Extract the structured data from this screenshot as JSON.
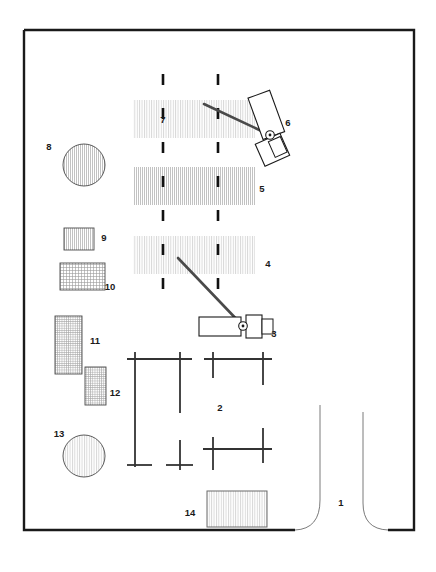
{
  "figure": {
    "type": "technical-floor-plan",
    "title": "",
    "background_color": "#ffffff",
    "line_color": "#1a1a1a",
    "hatch_color": "#9a9a9a",
    "width": 436,
    "height": 572
  },
  "frame": {
    "name": "enclosure-outline",
    "x": 24,
    "y": 30,
    "width": 390,
    "height": 500,
    "stroke_width": 2.4
  },
  "labels": [
    {
      "id": "1",
      "text": "1",
      "x": 341,
      "y": 506,
      "target": "entrance-opening"
    },
    {
      "id": "2",
      "text": "2",
      "x": 220,
      "y": 411,
      "target": "crosshair-grid"
    },
    {
      "id": "3",
      "text": "3",
      "x": 274,
      "y": 337,
      "target": "vehicle-lower"
    },
    {
      "id": "4",
      "text": "4",
      "x": 268,
      "y": 267,
      "target": "band-4"
    },
    {
      "id": "5",
      "text": "5",
      "x": 262,
      "y": 192,
      "target": "band-5"
    },
    {
      "id": "6",
      "text": "6",
      "x": 288,
      "y": 126,
      "target": "vehicle-upper"
    },
    {
      "id": "7",
      "text": "7",
      "x": 163,
      "y": 123,
      "target": "band-7"
    },
    {
      "id": "8",
      "text": "8",
      "x": 49,
      "y": 150,
      "target": "circle-8"
    },
    {
      "id": "9",
      "text": "9",
      "x": 104,
      "y": 241,
      "target": "rect-9"
    },
    {
      "id": "10",
      "text": "10",
      "x": 107,
      "y": 290,
      "target": "rect-10"
    },
    {
      "id": "11",
      "text": "11",
      "x": 92,
      "y": 344,
      "target": "rect-11"
    },
    {
      "id": "12",
      "text": "12",
      "x": 112,
      "y": 396,
      "target": "rect-12"
    },
    {
      "id": "13",
      "text": "13",
      "x": 59,
      "y": 437,
      "target": "circle-13"
    },
    {
      "id": "14",
      "text": "14",
      "x": 190,
      "y": 516,
      "target": "rect-14"
    }
  ],
  "bands": [
    {
      "name": "band-7",
      "x": 133,
      "y": 100,
      "width": 122,
      "height": 38
    },
    {
      "name": "band-5",
      "x": 133,
      "y": 167,
      "width": 122,
      "height": 38
    },
    {
      "name": "band-4",
      "x": 133,
      "y": 236,
      "width": 122,
      "height": 38
    }
  ],
  "dashed_lines": [
    {
      "name": "dashed-line-left",
      "x": 163,
      "y1": 74,
      "y2": 297
    },
    {
      "name": "dashed-line-right",
      "x": 218,
      "y1": 74,
      "y2": 297
    }
  ],
  "circles": [
    {
      "name": "circle-8",
      "cx": 84,
      "cy": 165,
      "r": 21
    },
    {
      "name": "circle-13",
      "cx": 84,
      "cy": 456,
      "r": 21
    }
  ],
  "rects": [
    {
      "name": "rect-9",
      "x": 64,
      "y": 228,
      "width": 30,
      "height": 22
    },
    {
      "name": "rect-10",
      "x": 60,
      "y": 263,
      "width": 45,
      "height": 27
    },
    {
      "name": "rect-11",
      "x": 55,
      "y": 316,
      "width": 27,
      "height": 58
    },
    {
      "name": "rect-12",
      "x": 85,
      "y": 367,
      "width": 21,
      "height": 38
    },
    {
      "name": "rect-14",
      "x": 207,
      "y": 491,
      "width": 60,
      "height": 36
    }
  ],
  "vehicles": [
    {
      "name": "vehicle-upper",
      "label_ref": "6",
      "rotation": -22,
      "body": {
        "x": 263,
        "y": 95,
        "width": 22,
        "height": 42
      },
      "cab": {
        "x": 264,
        "y": 140,
        "width": 26,
        "height": 22
      },
      "pivot": {
        "cx": 271,
        "cy": 136,
        "r": 4
      }
    },
    {
      "name": "vehicle-lower",
      "label_ref": "3",
      "rotation": 0,
      "body": {
        "x": 199,
        "y": 316,
        "width": 42,
        "height": 20
      },
      "cab": {
        "x": 245,
        "y": 314,
        "width": 16,
        "height": 23
      },
      "tail": {
        "x": 261,
        "y": 318,
        "width": 10,
        "height": 15
      },
      "pivot": {
        "cx": 243,
        "cy": 326,
        "r": 4
      }
    }
  ],
  "boom_arms": [
    {
      "name": "boom-arm-upper",
      "x1": 204,
      "y1": 104,
      "x2": 271,
      "y2": 136
    },
    {
      "name": "boom-arm-lower",
      "x1": 178,
      "y1": 258,
      "x2": 243,
      "y2": 326
    }
  ],
  "crosshairs": {
    "name": "crosshair-grid",
    "note": "column-grid markers drawn as cross ticks joined by beams",
    "verticals": [
      {
        "name": "crosshair-col-a",
        "x": 135,
        "y1": 352,
        "y2": 467
      },
      {
        "name": "crosshair-col-b",
        "x": 180,
        "y1": 352,
        "y2": 413
      },
      {
        "name": "crosshair-col-c",
        "x": 180,
        "y1": 440,
        "y2": 470
      },
      {
        "name": "crosshair-col-d",
        "x": 213,
        "y1": 352,
        "y2": 378
      },
      {
        "name": "crosshair-col-e",
        "x": 213,
        "y1": 444,
        "y2": 470
      },
      {
        "name": "crosshair-col-f",
        "x": 263,
        "y1": 352,
        "y2": 385
      },
      {
        "name": "crosshair-col-g",
        "x": 263,
        "y1": 430,
        "y2": 465
      }
    ],
    "horizontals": [
      {
        "name": "crosshair-beam-top-left",
        "x1": 128,
        "y": 359,
        "x2": 192
      },
      {
        "name": "crosshair-beam-top-right",
        "x1": 205,
        "y": 359,
        "x2": 272
      },
      {
        "name": "crosshair-beam-bottom-left",
        "x1": 128,
        "y": 465,
        "x2": 150
      },
      {
        "name": "crosshair-beam-bottom-mid",
        "x1": 165,
        "y": 465,
        "x2": 195
      },
      {
        "name": "crosshair-beam-bottom-right",
        "x1": 203,
        "y": 449,
        "x2": 272
      }
    ]
  },
  "entrance": {
    "name": "entrance-opening",
    "note": "rounded door jambs breaking the lower-right wall",
    "left_jamb": {
      "x": 320,
      "y_top": 405,
      "y_bottom": 505,
      "curve_to_x": 295,
      "curve_y": 530
    },
    "right_jamb": {
      "x": 363,
      "y_top": 412,
      "y_bottom": 508,
      "curve_to_x": 388,
      "curve_y": 530
    }
  }
}
